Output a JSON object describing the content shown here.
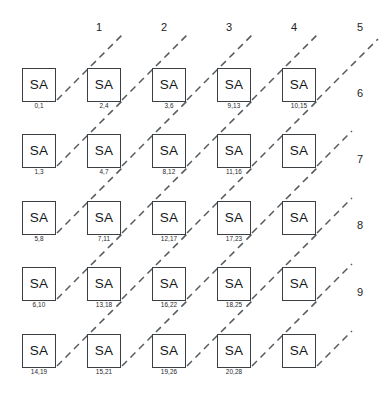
{
  "diagram": {
    "node_label": "SA",
    "colors": {
      "background": "#ffffff",
      "node_border": "#3b4045",
      "node_text": "#16191c",
      "dashed_line": "#555b5f",
      "caption_text": "#24282c",
      "index_text": "#1d2124"
    },
    "top_indices": [
      {
        "label": "1",
        "x": 99,
        "y": 22
      },
      {
        "label": "2",
        "x": 164,
        "y": 22
      },
      {
        "label": "3",
        "x": 229,
        "y": 22
      },
      {
        "label": "4",
        "x": 294,
        "y": 22
      },
      {
        "label": "5",
        "x": 360,
        "y": 22
      }
    ],
    "right_indices": [
      {
        "label": "6",
        "x": 360,
        "y": 88
      },
      {
        "label": "7",
        "x": 360,
        "y": 154
      },
      {
        "label": "8",
        "x": 360,
        "y": 220
      },
      {
        "label": "9",
        "x": 360,
        "y": 287
      }
    ],
    "rows": [
      {
        "row": 1,
        "nodes": [
          {
            "label": "SA",
            "caption": "0,1",
            "x": 22,
            "y": 68
          },
          {
            "label": "SA",
            "caption": "2,4",
            "x": 87,
            "y": 68
          },
          {
            "label": "SA",
            "caption": "3,6",
            "x": 152,
            "y": 68
          },
          {
            "label": "SA",
            "caption": "9,13",
            "x": 217,
            "y": 68
          },
          {
            "label": "SA",
            "caption": "10,15",
            "x": 282,
            "y": 68
          }
        ]
      },
      {
        "row": 2,
        "nodes": [
          {
            "label": "SA",
            "caption": "1,3",
            "x": 22,
            "y": 134
          },
          {
            "label": "SA",
            "caption": "4,7",
            "x": 87,
            "y": 134
          },
          {
            "label": "SA",
            "caption": "8,12",
            "x": 152,
            "y": 134
          },
          {
            "label": "SA",
            "caption": "11,16",
            "x": 217,
            "y": 134
          },
          {
            "label": "SA",
            "caption": "",
            "x": 282,
            "y": 134
          }
        ]
      },
      {
        "row": 3,
        "nodes": [
          {
            "label": "SA",
            "caption": "5,8",
            "x": 22,
            "y": 201
          },
          {
            "label": "SA",
            "caption": "7,11",
            "x": 87,
            "y": 201
          },
          {
            "label": "SA",
            "caption": "12,17",
            "x": 152,
            "y": 201
          },
          {
            "label": "SA",
            "caption": "17,23",
            "x": 217,
            "y": 201
          },
          {
            "label": "SA",
            "caption": "",
            "x": 282,
            "y": 201
          }
        ]
      },
      {
        "row": 4,
        "nodes": [
          {
            "label": "SA",
            "caption": "6,10",
            "x": 22,
            "y": 267
          },
          {
            "label": "SA",
            "caption": "13,18",
            "x": 87,
            "y": 267
          },
          {
            "label": "SA",
            "caption": "16,22",
            "x": 152,
            "y": 267
          },
          {
            "label": "SA",
            "caption": "18,25",
            "x": 217,
            "y": 267
          },
          {
            "label": "SA",
            "caption": "",
            "x": 282,
            "y": 267
          }
        ]
      },
      {
        "row": 5,
        "nodes": [
          {
            "label": "SA",
            "caption": "14,19",
            "x": 22,
            "y": 334
          },
          {
            "label": "SA",
            "caption": "15,21",
            "x": 87,
            "y": 334
          },
          {
            "label": "SA",
            "caption": "19,26",
            "x": 152,
            "y": 334
          },
          {
            "label": "SA",
            "caption": "20,28",
            "x": 217,
            "y": 334
          },
          {
            "label": "SA",
            "caption": "",
            "x": 282,
            "y": 334
          }
        ]
      }
    ],
    "diagonals": [
      {
        "name": "diagonal-1",
        "x1": 57,
        "y1": 100,
        "x2": 122,
        "y2": 35
      },
      {
        "name": "diagonal-2",
        "x1": 122,
        "y1": 100,
        "x2": 187,
        "y2": 35
      },
      {
        "name": "diagonal-3",
        "x1": 187,
        "y1": 100,
        "x2": 252,
        "y2": 35
      },
      {
        "name": "diagonal-4",
        "x1": 252,
        "y1": 100,
        "x2": 317,
        "y2": 35
      },
      {
        "name": "diagonal-5",
        "x1": 317,
        "y1": 100,
        "x2": 378,
        "y2": 39
      },
      {
        "name": "diagonal-6a",
        "x1": 57,
        "y1": 166,
        "x2": 122,
        "y2": 101
      },
      {
        "name": "diagonal-6b",
        "x1": 122,
        "y1": 166,
        "x2": 187,
        "y2": 101
      },
      {
        "name": "diagonal-6c",
        "x1": 187,
        "y1": 166,
        "x2": 252,
        "y2": 101
      },
      {
        "name": "diagonal-6d",
        "x1": 252,
        "y1": 166,
        "x2": 317,
        "y2": 101
      },
      {
        "name": "diagonal-6e",
        "x1": 317,
        "y1": 166,
        "x2": 352,
        "y2": 131
      },
      {
        "name": "diagonal-7a",
        "x1": 57,
        "y1": 233,
        "x2": 122,
        "y2": 168
      },
      {
        "name": "diagonal-7b",
        "x1": 122,
        "y1": 233,
        "x2": 187,
        "y2": 168
      },
      {
        "name": "diagonal-7c",
        "x1": 187,
        "y1": 233,
        "x2": 252,
        "y2": 168
      },
      {
        "name": "diagonal-7d",
        "x1": 252,
        "y1": 233,
        "x2": 317,
        "y2": 168
      },
      {
        "name": "diagonal-7e",
        "x1": 317,
        "y1": 233,
        "x2": 352,
        "y2": 198
      },
      {
        "name": "diagonal-8a",
        "x1": 57,
        "y1": 299,
        "x2": 122,
        "y2": 234
      },
      {
        "name": "diagonal-8b",
        "x1": 122,
        "y1": 299,
        "x2": 187,
        "y2": 234
      },
      {
        "name": "diagonal-8c",
        "x1": 187,
        "y1": 299,
        "x2": 252,
        "y2": 234
      },
      {
        "name": "diagonal-8d",
        "x1": 252,
        "y1": 299,
        "x2": 317,
        "y2": 234
      },
      {
        "name": "diagonal-8e",
        "x1": 317,
        "y1": 299,
        "x2": 352,
        "y2": 264
      },
      {
        "name": "diagonal-9a",
        "x1": 57,
        "y1": 366,
        "x2": 122,
        "y2": 301
      },
      {
        "name": "diagonal-9b",
        "x1": 122,
        "y1": 366,
        "x2": 187,
        "y2": 301
      },
      {
        "name": "diagonal-9c",
        "x1": 187,
        "y1": 366,
        "x2": 252,
        "y2": 301
      },
      {
        "name": "diagonal-9d",
        "x1": 252,
        "y1": 366,
        "x2": 317,
        "y2": 301
      },
      {
        "name": "diagonal-9e",
        "x1": 317,
        "y1": 366,
        "x2": 352,
        "y2": 331
      }
    ]
  }
}
